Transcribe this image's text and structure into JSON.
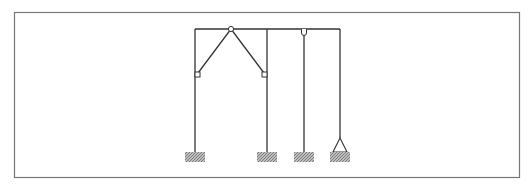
{
  "diagram": {
    "type": "structural-frame",
    "colors": {
      "line": "#333333",
      "frame_border": "#777777",
      "hatch": "#888888",
      "background": "#ffffff"
    },
    "border": {
      "x": 14,
      "y": 12,
      "width": 505,
      "height": 165
    },
    "top_beam": {
      "x1": 195,
      "x2": 340,
      "y": 29
    },
    "columns": [
      {
        "id": "col-1",
        "x": 195,
        "y_top": 29,
        "y_bottom": 152,
        "support": "fixed"
      },
      {
        "id": "col-2",
        "x": 267,
        "y_top": 29,
        "y_bottom": 152,
        "support": "fixed"
      },
      {
        "id": "col-3",
        "x": 304,
        "y_top": 29,
        "y_bottom": 152,
        "support": "fixed",
        "top_hinge": true
      },
      {
        "id": "col-4",
        "x": 340,
        "y_top": 29,
        "y_bottom": 138,
        "support": "pinned"
      }
    ],
    "hinges": [
      {
        "id": "hinge-top-apex",
        "x": 231,
        "y": 29
      },
      {
        "id": "hinge-left-strut",
        "x": 197,
        "y": 75
      },
      {
        "id": "hinge-right-strut",
        "x": 265,
        "y": 75
      },
      {
        "id": "hinge-col-3-top",
        "x": 304,
        "y": 32
      }
    ],
    "struts": [
      {
        "id": "strut-left",
        "x1": 231,
        "y1": 29,
        "x2": 197,
        "y2": 75
      },
      {
        "id": "strut-right",
        "x1": 231,
        "y1": 29,
        "x2": 265,
        "y2": 75
      }
    ]
  }
}
